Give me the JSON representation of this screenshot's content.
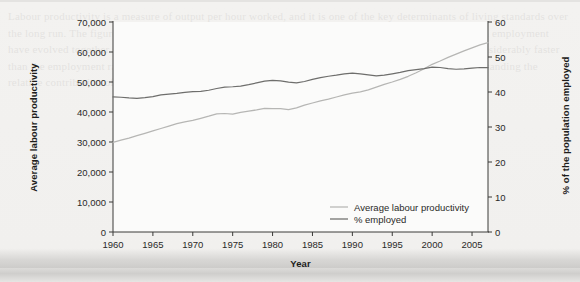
{
  "figure": {
    "background_color": "#f1f0ee",
    "plot_background": "#fbfbfa",
    "ghost_text": "Labour productivity is a measure of output per hour worked, and it is one of the key determinants of living standards over the long run. The figure below shows how average labour productivity and the share of the population in employment have evolved together since 1960. Both series have trended upwards, though productivity has grown considerably faster than the employment rate, which has fluctuated with the business cycle and flattened after 2000. Understanding the relative contribution of each to total output growth is an important question in macroeconomics."
  },
  "chart_data": {
    "type": "line",
    "title": "",
    "xlabel": "Year",
    "ylabel": "Average labour productivity",
    "ylabel_right": "% of the population employed",
    "grid": false,
    "legend_position": "bottom-right-inside",
    "xlim": [
      1960,
      2007
    ],
    "xticks": [
      1960,
      1965,
      1970,
      1975,
      1980,
      1985,
      1990,
      1995,
      2000,
      2005
    ],
    "xtick_labels": [
      "1960",
      "1965",
      "1970",
      "1975",
      "1980",
      "1985",
      "1990",
      "1995",
      "2000",
      "2005"
    ],
    "ylim": [
      0,
      70000
    ],
    "yticks": [
      0,
      10000,
      20000,
      30000,
      40000,
      50000,
      60000,
      70000
    ],
    "ytick_labels": [
      "0",
      "10,000",
      "20,000",
      "30,000",
      "40,000",
      "50,000",
      "60,000",
      "70,000"
    ],
    "ylim_right": [
      0,
      60
    ],
    "yticks_right": [
      0,
      10,
      20,
      30,
      40,
      50,
      60
    ],
    "ytick_labels_right": [
      "0",
      "10",
      "20",
      "30",
      "40",
      "50",
      "60"
    ],
    "x": [
      1960,
      1961,
      1962,
      1963,
      1964,
      1965,
      1966,
      1967,
      1968,
      1969,
      1970,
      1971,
      1972,
      1973,
      1974,
      1975,
      1976,
      1977,
      1978,
      1979,
      1980,
      1981,
      1982,
      1983,
      1984,
      1985,
      1986,
      1987,
      1988,
      1989,
      1990,
      1991,
      1992,
      1993,
      1994,
      1995,
      1996,
      1997,
      1998,
      1999,
      2000,
      2001,
      2002,
      2003,
      2004,
      2005,
      2006,
      2007
    ],
    "series": [
      {
        "name": "Average labour productivity",
        "axis": "left",
        "color": "#b6b6b4",
        "values": [
          29900,
          30600,
          31300,
          32100,
          32900,
          33700,
          34500,
          35300,
          36100,
          36700,
          37200,
          37900,
          38600,
          39400,
          39500,
          39300,
          39900,
          40300,
          40700,
          41200,
          41100,
          41100,
          40800,
          41400,
          42300,
          43000,
          43700,
          44300,
          45000,
          45700,
          46300,
          46700,
          47400,
          48300,
          49200,
          50000,
          50900,
          51900,
          53100,
          54400,
          55900,
          57000,
          58200,
          59300,
          60400,
          61400,
          62400,
          63100
        ]
      },
      {
        "name": "% employed",
        "axis": "right",
        "color": "#6e6e6c",
        "values": [
          38.6,
          38.5,
          38.3,
          38.2,
          38.4,
          38.7,
          39.2,
          39.4,
          39.6,
          39.9,
          40.1,
          40.2,
          40.5,
          41.0,
          41.4,
          41.5,
          41.7,
          42.1,
          42.6,
          43.1,
          43.3,
          43.2,
          42.8,
          42.6,
          43.0,
          43.6,
          44.1,
          44.5,
          44.8,
          45.2,
          45.4,
          45.2,
          44.9,
          44.6,
          44.8,
          45.2,
          45.6,
          46.1,
          46.4,
          46.7,
          47.1,
          47.0,
          46.7,
          46.5,
          46.6,
          46.8,
          47.0,
          47.0
        ]
      }
    ],
    "legend": [
      {
        "label": "Average labour productivity",
        "color": "#b6b6b4"
      },
      {
        "label": "% employed",
        "color": "#6e6e6c"
      }
    ]
  }
}
